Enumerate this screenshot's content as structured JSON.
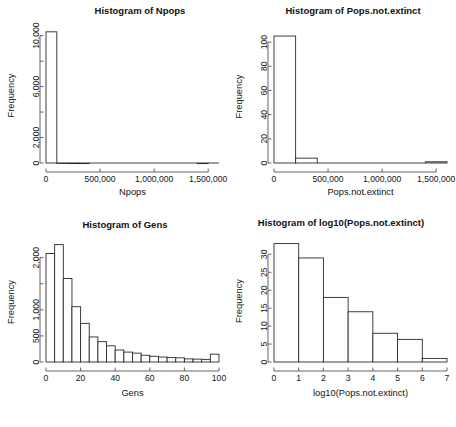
{
  "figure": {
    "layout": "2x2 grid of histograms",
    "background": "#ffffff",
    "bar_fill": "#ffffff",
    "bar_stroke": "#2a2a2a",
    "axis_color": "#555555"
  },
  "panels": [
    {
      "id": "npops",
      "title": "Histogram of Npops",
      "xlabel": "Npops",
      "ylabel": "Frequency",
      "x_ticklabels": [
        "0",
        "500,000",
        "1,000,000",
        "1,500,000"
      ],
      "y_ticklabels": [
        "0",
        "2,000",
        "",
        "6,000",
        "",
        "10,000"
      ]
    },
    {
      "id": "pops-not-extinct",
      "title": "Histogram of Pops.not.extinct",
      "xlabel": "Pops.not.extinct",
      "ylabel": "Frequency",
      "x_ticklabels": [
        "0",
        "500,000",
        "1,000,000",
        "1,500,000"
      ],
      "y_ticklabels": [
        "0",
        "20",
        "40",
        "60",
        "80",
        "100"
      ]
    },
    {
      "id": "gens",
      "title": "Histogram of Gens",
      "xlabel": "Gens",
      "ylabel": "Frequency",
      "x_ticklabels": [
        "0",
        "20",
        "40",
        "60",
        "80",
        "100"
      ],
      "y_ticklabels": [
        "0",
        "500",
        "1,000",
        "",
        "2,000"
      ]
    },
    {
      "id": "log10-pops-not-extinct",
      "title": "Histogram of log10(Pops.not.extinct)",
      "xlabel": "log10(Pops.not.extinct)",
      "ylabel": "Frequency",
      "x_ticklabels": [
        "0",
        "1",
        "2",
        "3",
        "4",
        "5",
        "6",
        "7"
      ],
      "y_ticklabels": [
        "0",
        "5",
        "10",
        "15",
        "20",
        "25",
        "30"
      ]
    }
  ],
  "chart_data": [
    {
      "type": "bar",
      "id": "npops",
      "title": "Histogram of Npops",
      "xlabel": "Npops",
      "ylabel": "Frequency",
      "xlim": [
        0,
        1600000
      ],
      "ylim": [
        0,
        10600
      ],
      "x_ticks": [
        0,
        500000,
        1000000,
        1500000
      ],
      "x_ticklabels": [
        "0",
        "500,000",
        "1,000,000",
        "1,500,000"
      ],
      "y_ticks": [
        0,
        2000,
        4000,
        6000,
        8000,
        10000
      ],
      "y_ticklabels": [
        "0",
        "2,000",
        "",
        "6,000",
        "",
        "10,000"
      ],
      "grid": false,
      "legend": null,
      "bin_edges": [
        0,
        100000,
        200000,
        300000,
        400000,
        500000,
        600000,
        700000,
        800000,
        900000,
        1000000,
        1100000,
        1200000,
        1300000,
        1400000,
        1500000,
        1600000
      ],
      "values": [
        10300,
        5,
        2,
        1,
        0,
        0,
        0,
        0,
        0,
        0,
        0,
        0,
        0,
        0,
        1,
        0
      ]
    },
    {
      "type": "bar",
      "id": "pops-not-extinct",
      "title": "Histogram of Pops.not.extinct",
      "xlabel": "Pops.not.extinct",
      "ylabel": "Frequency",
      "xlim": [
        0,
        1600000
      ],
      "ylim": [
        0,
        110
      ],
      "x_ticks": [
        0,
        500000,
        1000000,
        1500000
      ],
      "x_ticklabels": [
        "0",
        "500,000",
        "1,000,000",
        "1,500,000"
      ],
      "y_ticks": [
        0,
        20,
        40,
        60,
        80,
        100
      ],
      "y_ticklabels": [
        "0",
        "20",
        "40",
        "60",
        "80",
        "100"
      ],
      "grid": false,
      "legend": null,
      "bin_edges": [
        0,
        200000,
        400000,
        600000,
        800000,
        1000000,
        1200000,
        1400000,
        1600000
      ],
      "values": [
        105,
        4,
        0,
        0,
        0,
        0,
        0,
        1
      ]
    },
    {
      "type": "bar",
      "id": "gens",
      "title": "Histogram of Gens",
      "xlabel": "Gens",
      "ylabel": "Frequency",
      "xlim": [
        0,
        100
      ],
      "ylim": [
        0,
        2300
      ],
      "x_ticks": [
        0,
        20,
        40,
        60,
        80,
        100
      ],
      "x_ticklabels": [
        "0",
        "20",
        "40",
        "60",
        "80",
        "100"
      ],
      "y_ticks": [
        0,
        500,
        1000,
        1500,
        2000
      ],
      "y_ticklabels": [
        "0",
        "500",
        "1,000",
        "",
        "2,000"
      ],
      "grid": false,
      "legend": null,
      "bin_edges": [
        0,
        5,
        10,
        15,
        20,
        25,
        30,
        35,
        40,
        45,
        50,
        55,
        60,
        65,
        70,
        75,
        80,
        85,
        90,
        95,
        100
      ],
      "values": [
        2080,
        2250,
        1600,
        1060,
        740,
        480,
        390,
        310,
        230,
        190,
        170,
        130,
        110,
        95,
        85,
        80,
        60,
        55,
        50,
        150
      ]
    },
    {
      "type": "bar",
      "id": "log10-pops-not-extinct",
      "title": "Histogram of log10(Pops.not.extinct)",
      "xlabel": "log10(Pops.not.extinct)",
      "ylabel": "Frequency",
      "xlim": [
        0,
        7
      ],
      "ylim": [
        0,
        34
      ],
      "x_ticks": [
        0,
        1,
        2,
        3,
        4,
        5,
        6,
        7
      ],
      "x_ticklabels": [
        "0",
        "1",
        "2",
        "3",
        "4",
        "5",
        "6",
        "7"
      ],
      "y_ticks": [
        0,
        5,
        10,
        15,
        20,
        25,
        30
      ],
      "y_ticklabels": [
        "0",
        "5",
        "10",
        "15",
        "20",
        "25",
        "30"
      ],
      "grid": false,
      "legend": null,
      "bin_edges": [
        0,
        1,
        2,
        3,
        4,
        5,
        6,
        7
      ],
      "values": [
        33,
        29,
        18,
        14,
        8,
        6.3,
        1
      ]
    }
  ]
}
